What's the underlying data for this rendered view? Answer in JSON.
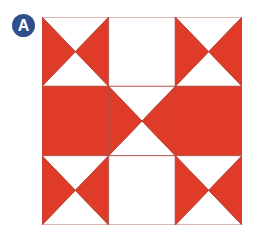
{
  "badge": {
    "label": "A",
    "color": "#2f4f8c"
  },
  "quilt": {
    "red": "#e03a28",
    "line": "#b0483c",
    "white": "#ffffff",
    "rows": 3,
    "cols": 3,
    "blocks": [
      [
        "hourglass",
        "plain",
        "hourglass"
      ],
      [
        "solid",
        "bowtie-center",
        "solid"
      ],
      [
        "hourglass",
        "plain",
        "hourglass"
      ]
    ]
  }
}
